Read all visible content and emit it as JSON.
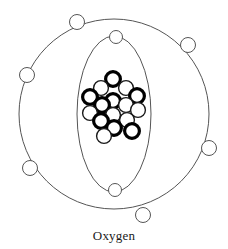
{
  "figure": {
    "title": "Oxygen",
    "caption": "Oxygen",
    "type": "bohr-atomic-model",
    "background_color": "#ffffff"
  },
  "colors": {
    "shell_stroke": "#555555",
    "electron_stroke": "#555555",
    "electron_fill": "#ffffff",
    "proton_stroke": "#000000",
    "proton_fill": "#ffffff",
    "neutron_stroke": "#1a1a1a",
    "neutron_fill": "#ffffff",
    "caption_color": "#1a1a1a"
  },
  "geometry": {
    "center_x": 114,
    "center_y": 114,
    "outer_shell": {
      "label": "outer-electron-shell",
      "shape": "circle",
      "rx": 95,
      "ry": 95,
      "stroke_width": 1
    },
    "inner_shell": {
      "label": "inner-electron-shell",
      "shape": "ellipse",
      "rx": 37,
      "ry": 78,
      "stroke_width": 1
    }
  },
  "shells": [
    {
      "name": "inner-shell",
      "index": 1,
      "electron_count": 2,
      "electron_radius": 6.5,
      "electrons": [
        {
          "name": "inner-electron-1",
          "cx": 116,
          "cy": 37
        },
        {
          "name": "inner-electron-2",
          "cx": 115,
          "cy": 190
        }
      ]
    },
    {
      "name": "outer-shell",
      "index": 2,
      "electron_count": 6,
      "electron_radius": 7.5,
      "electrons": [
        {
          "name": "outer-electron-1",
          "cx": 77,
          "cy": 22
        },
        {
          "name": "outer-electron-2",
          "cx": 188,
          "cy": 45
        },
        {
          "name": "outer-electron-3",
          "cx": 27,
          "cy": 75
        },
        {
          "name": "outer-electron-4",
          "cx": 209,
          "cy": 148
        },
        {
          "name": "outer-electron-5",
          "cx": 30,
          "cy": 168
        },
        {
          "name": "outer-electron-6",
          "cx": 143,
          "cy": 215
        }
      ]
    }
  ],
  "nucleus": {
    "name": "nucleus",
    "proton_count": 8,
    "neutron_count": 8,
    "particle_radius": 7.4,
    "proton_stroke_width": 3.2,
    "neutron_stroke_width": 1.4,
    "particles": [
      {
        "name": "proton-1",
        "type": "proton",
        "cx": 113,
        "cy": 79
      },
      {
        "name": "neutron-1",
        "type": "neutron",
        "cx": 101,
        "cy": 88
      },
      {
        "name": "neutron-2",
        "type": "neutron",
        "cx": 126,
        "cy": 88
      },
      {
        "name": "proton-2",
        "type": "proton",
        "cx": 137,
        "cy": 96
      },
      {
        "name": "proton-3",
        "type": "proton",
        "cx": 90,
        "cy": 97
      },
      {
        "name": "proton-4",
        "type": "proton",
        "cx": 113,
        "cy": 101
      },
      {
        "name": "neutron-3",
        "type": "neutron",
        "cx": 126,
        "cy": 105
      },
      {
        "name": "proton-5",
        "type": "proton",
        "cx": 102,
        "cy": 105
      },
      {
        "name": "neutron-4",
        "type": "neutron",
        "cx": 138,
        "cy": 110
      },
      {
        "name": "neutron-5",
        "type": "neutron",
        "cx": 90,
        "cy": 113
      },
      {
        "name": "neutron-6",
        "type": "neutron",
        "cx": 113,
        "cy": 115
      },
      {
        "name": "proton-6",
        "type": "proton",
        "cx": 101,
        "cy": 121
      },
      {
        "name": "neutron-7",
        "type": "neutron",
        "cx": 127,
        "cy": 120
      },
      {
        "name": "proton-7",
        "type": "proton",
        "cx": 114,
        "cy": 128
      },
      {
        "name": "proton-8",
        "type": "proton",
        "cx": 132,
        "cy": 131
      },
      {
        "name": "neutron-8",
        "type": "neutron",
        "cx": 104,
        "cy": 136
      }
    ]
  }
}
